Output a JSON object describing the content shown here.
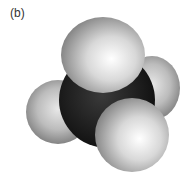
{
  "figure": {
    "label": "(b)",
    "atoms": [
      {
        "name": "carbon",
        "color": "#1a1a1a"
      },
      {
        "name": "hydrogen-top",
        "color": "#d0d0d0"
      },
      {
        "name": "hydrogen-right",
        "color": "#c8c8c8"
      },
      {
        "name": "hydrogen-left",
        "color": "#c8c8c8"
      },
      {
        "name": "hydrogen-front",
        "color": "#d4d4d4"
      }
    ]
  }
}
